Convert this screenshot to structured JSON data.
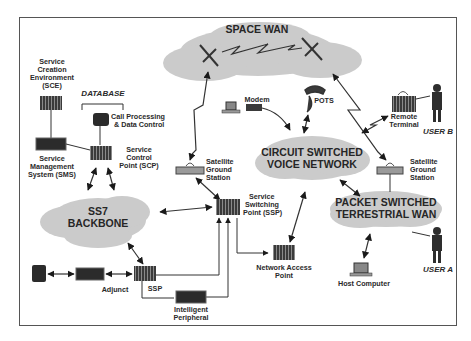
{
  "diagram": {
    "clouds": {
      "space_wan": "SPACE WAN",
      "ss7_line1": "SS7",
      "ss7_line2": "BACKBONE",
      "circuit_line1": "CIRCUIT SWITCHED",
      "circuit_line2": "VOICE NETWORK",
      "packet_line1": "PACKET SWITCHED",
      "packet_line2": "TERRESTRIAL WAN"
    },
    "nodes": {
      "sce_l1": "Service",
      "sce_l2": "Creation",
      "sce_l3": "Environment",
      "sce_l4": "(SCE)",
      "database": "DATABASE",
      "callproc_l1": "Call Processing",
      "callproc_l2": "& Data Control",
      "sms_l1": "Service",
      "sms_l2": "Management",
      "sms_l3": "System (SMS)",
      "scp_l1": "Service",
      "scp_l2": "Control",
      "scp_l3": "Point (SCP)",
      "modem": "Modem",
      "pots": "POTS",
      "sat_left_l1": "Satellite",
      "sat_left_l2": "Ground",
      "sat_left_l3": "Station",
      "sat_right_l1": "Satellite",
      "sat_right_l2": "Ground",
      "sat_right_l3": "Station",
      "remote_l1": "Remote",
      "remote_l2": "Terminal",
      "user_b": "USER B",
      "user_a": "USER A",
      "ssp_main_l1": "Service",
      "ssp_main_l2": "Switching",
      "ssp_main_l3": "Point (SSP)",
      "nap_l1": "Network Access",
      "nap_l2": "Point",
      "host": "Host Computer",
      "adjunct": "Adjunct",
      "ssp_small": "SSP",
      "ip_l1": "Intelligent",
      "ip_l2": "Peripheral"
    },
    "colors": {
      "cloud_fill": "#c9c9c9",
      "equipment_dark": "#2b2b2b",
      "frame": "#555555",
      "line": "#333333"
    }
  }
}
